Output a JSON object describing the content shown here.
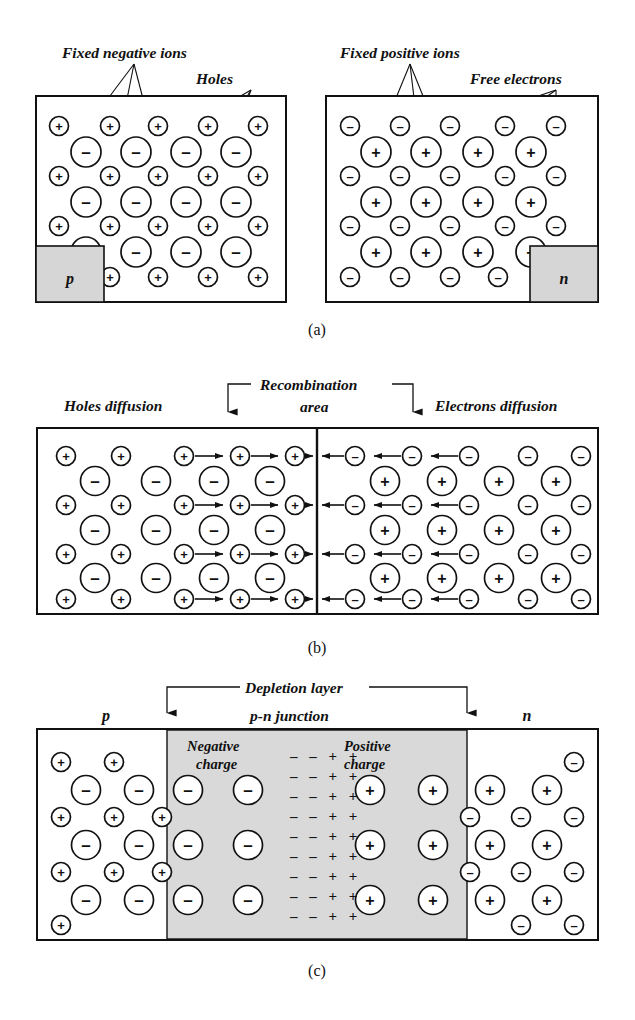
{
  "figure": {
    "background_color": "#ffffff",
    "line_color": "#111111",
    "shade_color": "#d6d6d6",
    "depletion_color": "#d9d9d9"
  },
  "panels": [
    {
      "id": "a",
      "caption": "(a)",
      "labels": {
        "fixed_negative_ions": "Fixed negative ions",
        "holes": "Holes",
        "fixed_positive_ions": "Fixed positive ions",
        "free_electrons": "Free electrons",
        "p_region": "p",
        "n_region": "n"
      },
      "left_block": {
        "material": "p",
        "mobile_carrier_symbol": "+",
        "fixed_ion_symbol": "-",
        "mobile_carrier_name": "holes",
        "fixed_ion_name": "fixed negative ions",
        "small_rows": 4,
        "small_per_row": 5,
        "large_rows": 3,
        "large_per_row": 4
      },
      "right_block": {
        "material": "n",
        "mobile_carrier_symbol": "-",
        "fixed_ion_symbol": "+",
        "mobile_carrier_name": "free electrons",
        "fixed_ion_name": "fixed positive ions",
        "small_rows": 4,
        "small_per_row": 5,
        "large_rows": 3,
        "large_per_row": 4
      }
    },
    {
      "id": "b",
      "caption": "(b)",
      "labels": {
        "holes_diffusion": "Holes diffusion",
        "recombination_area_line1": "Recombination",
        "recombination_area_line2": "area",
        "electrons_diffusion": "Electrons diffusion"
      },
      "left_block": {
        "material": "p",
        "mobile_carrier_symbol": "+",
        "fixed_ion_symbol": "-",
        "drift_direction": "right",
        "small_rows": 4,
        "small_per_row": 5,
        "arrow_columns": [
          3,
          4,
          5
        ],
        "large_rows": 3,
        "large_per_row": 4
      },
      "right_block": {
        "material": "n",
        "mobile_carrier_symbol": "-",
        "fixed_ion_symbol": "+",
        "drift_direction": "left",
        "small_rows": 4,
        "small_per_row": 5,
        "arrow_columns": [
          1,
          2,
          3
        ],
        "large_rows": 3,
        "large_per_row": 4
      }
    },
    {
      "id": "c",
      "caption": "(c)",
      "labels": {
        "depletion_layer": "Depletion layer",
        "pn_junction": "p-n junction",
        "negative_charge_line1": "Negative",
        "negative_charge_line2": "charge",
        "positive_charge_line1": "Positive",
        "positive_charge_line2": "charge",
        "p_region": "p",
        "n_region": "n"
      },
      "left_neutral": {
        "material": "p",
        "small_symbol": "+",
        "large_symbol": "-",
        "small_rows": 3,
        "large_rows": 3
      },
      "depletion": {
        "negative_side_symbol": "-",
        "negative_columns": 2,
        "positive_side_symbol": "+",
        "positive_columns": 2,
        "rows": 3,
        "field_rows": 9,
        "field_pattern": "− − + +"
      },
      "right_neutral": {
        "material": "n",
        "small_symbol": "-",
        "large_symbol": "+",
        "small_rows": 3,
        "large_rows": 3
      }
    }
  ],
  "captions": {
    "a": "(a)",
    "b": "(b)",
    "c": "(c)"
  }
}
